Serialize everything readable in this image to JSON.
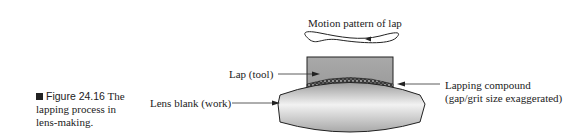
{
  "figure": {
    "number": "Figure 24.16",
    "caption": "The lapping process in lens-making.",
    "caption_line1": "The",
    "caption_line2": "lapping process in",
    "caption_line3": "lens-making."
  },
  "labels": {
    "motion": "Motion pattern of lap",
    "lap": "Lap (tool)",
    "lens": "Lens blank (work)",
    "compound_line1": "Lapping compound",
    "compound_line2": "(gap/grit size exaggerated)"
  }
}
